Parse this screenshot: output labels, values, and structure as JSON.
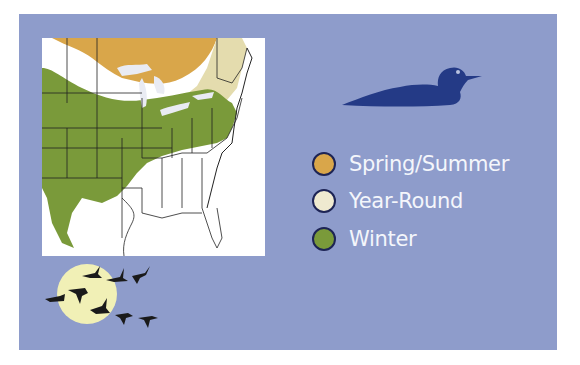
{
  "figure": {
    "type": "range-map",
    "background_color": "#8e9ccb",
    "map_region": "Eastern United States",
    "icon_species": "duck-silhouette",
    "icon_color": "#243a86"
  },
  "legend": {
    "items": [
      {
        "label": "Spring/Summer",
        "color": "#d9a64a"
      },
      {
        "label": "Year-Round",
        "color": "#efead0"
      },
      {
        "label": "Winter",
        "color": "#7a9a3a"
      }
    ]
  },
  "decoration": {
    "moon_color": "#f1f0b6",
    "bird_color": "#1a1a1a",
    "bird_count": 8
  }
}
